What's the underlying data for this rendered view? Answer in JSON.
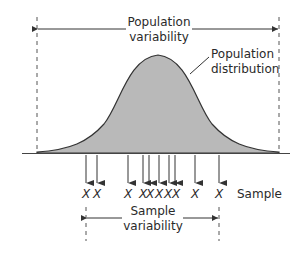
{
  "diagram": {
    "type": "sampling-variability",
    "colors": {
      "curve_fill": "#b9b9b9",
      "curve_stroke": "#333333",
      "line": "#333333",
      "dash": "#555555",
      "background": "#ffffff"
    },
    "population_variability": {
      "line1": "Population",
      "line2": "variability"
    },
    "population_distribution": {
      "line1": "Population",
      "line2": "distribution"
    },
    "sample_label": "Sample",
    "sample_marker": "X",
    "sample_count": 10,
    "sample_variability": {
      "line1": "Sample",
      "line2": "variability"
    }
  }
}
